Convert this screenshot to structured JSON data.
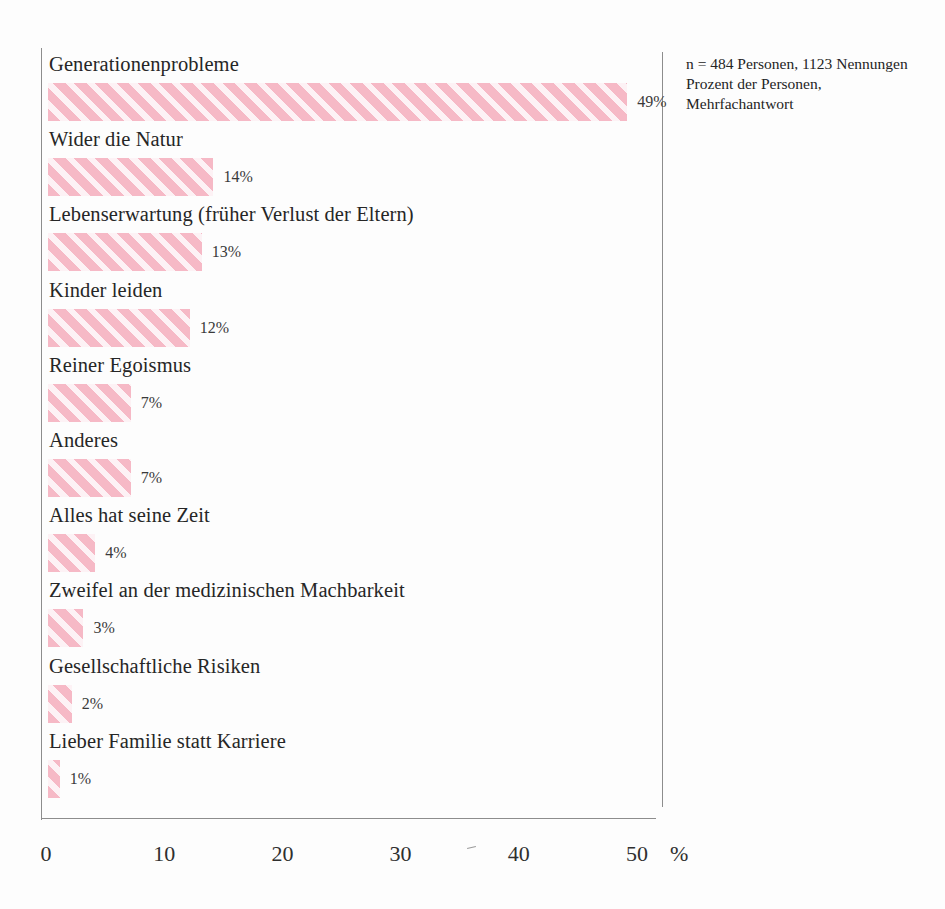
{
  "chart_data": {
    "type": "bar",
    "orientation": "horizontal",
    "title": "",
    "xlabel": "%",
    "ylabel": "",
    "xlim": [
      0,
      50
    ],
    "xticks": [
      0,
      10,
      20,
      30,
      40,
      50
    ],
    "xtick_labels": [
      "0",
      "10",
      "20",
      "30",
      "40",
      "50"
    ],
    "grid": false,
    "legend": false,
    "bar_color": "#f6b9c6",
    "bar_pattern": "diagonal-hatch",
    "categories": [
      "Generationenprobleme",
      "Wider die Natur",
      "Lebenserwartung (früher Verlust der Eltern)",
      "Kinder leiden",
      "Reiner Egoismus",
      "Anderes",
      "Alles hat seine Zeit",
      "Zweifel an der medizinischen Machbarkeit",
      "Gesellschaftliche Risiken",
      "Lieber Familie statt Karriere"
    ],
    "values": [
      49,
      14,
      13,
      12,
      7,
      7,
      4,
      3,
      2,
      1
    ],
    "value_labels": [
      "49%",
      "14%",
      "13%",
      "12%",
      "7%",
      "7%",
      "4%",
      "3%",
      "2%",
      "1%"
    ]
  },
  "note": {
    "line1": "n = 484 Personen, 1123 Nennungen",
    "line2": "Prozent der Personen,",
    "line3": "Mehrfachantwort"
  },
  "axis": {
    "unit": "%"
  }
}
